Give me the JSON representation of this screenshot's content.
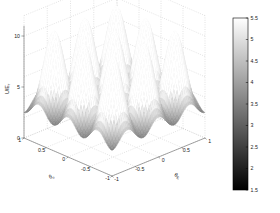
{
  "figure": {
    "kind": "3d-surface-plot",
    "background": "#ffffff",
    "colormap": "gray",
    "width": 280,
    "height": 213
  },
  "axes": {
    "z": {
      "label": "U/E",
      "label_sub": "r",
      "ticks": [
        "0",
        "5",
        "10"
      ],
      "tick_values": [
        0,
        5,
        10
      ],
      "range": [
        0,
        12
      ]
    },
    "left": {
      "label": "θ",
      "label_sub": "n",
      "ticks": [
        "1",
        "0.5",
        "0",
        "-0.5",
        "-1"
      ],
      "tick_values": [
        1,
        0.5,
        0,
        -0.5,
        -1
      ],
      "range": [
        -1,
        1
      ]
    },
    "right": {
      "label": "θ",
      "label_sub": "E",
      "ticks": [
        "-1",
        "-0.5",
        "0",
        "0.5",
        "1"
      ],
      "tick_values": [
        -1,
        -0.5,
        0,
        0.5,
        1
      ],
      "range": [
        -1,
        1
      ]
    }
  },
  "colorbar": {
    "ticks": [
      "5.5",
      "5",
      "4.5",
      "4",
      "3.5",
      "3",
      "2.5",
      "2",
      "1.5"
    ],
    "tick_values": [
      5.5,
      5,
      4.5,
      4,
      3.5,
      3,
      2.5,
      2,
      1.5
    ],
    "min": 1.5,
    "max": 5.5,
    "low_color": "#000000",
    "high_color": "#ffffff",
    "border_color": "#000000"
  },
  "chart_data": {
    "type": "surface",
    "title": "",
    "xlabel": "θ_E",
    "ylabel": "θ_n",
    "zlabel": "U/E_r",
    "xlim": [
      -1,
      1
    ],
    "ylim": [
      -1,
      1
    ],
    "zlim": [
      0,
      12
    ],
    "grid": true,
    "legend": "none",
    "colorbar_range": [
      1.5,
      5.5
    ],
    "surface_model": {
      "formula": "z = A + B*(cos(pi*k*x) + cos(pi*k*y)) + C*cos(pi*k*x)*cos(pi*k*y)",
      "A": 5.2,
      "B": 2.0,
      "C": 1.3,
      "k": 3,
      "nx": 56,
      "ny": 56
    },
    "x_ticks": [
      -1,
      -0.5,
      0,
      0.5,
      1
    ],
    "y_ticks": [
      -1,
      -0.5,
      0,
      0.5,
      1
    ],
    "z_ticks": [
      0,
      5,
      10
    ]
  }
}
